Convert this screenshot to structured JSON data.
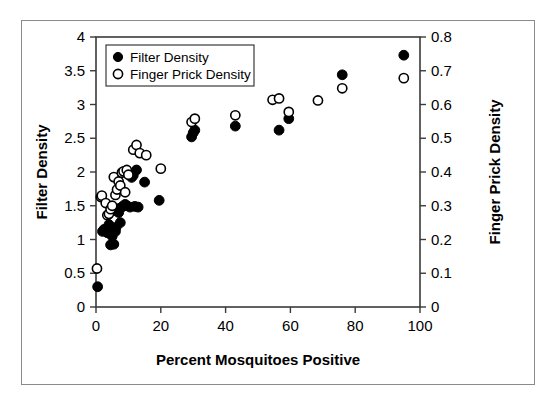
{
  "chart_data": {
    "type": "scatter",
    "title": "",
    "xlabel": "Percent Mosquitoes Positive",
    "ylabel": "Filter Density",
    "y2label": "Finger Prick Density",
    "xlim": [
      0,
      100
    ],
    "ylim": [
      0,
      4
    ],
    "y2lim": [
      0,
      0.8
    ],
    "grid": false,
    "legend_position": "top-left",
    "xticks": [
      "0",
      "20",
      "40",
      "60",
      "80",
      "100"
    ],
    "xtick_values": [
      0,
      20,
      40,
      60,
      80,
      100
    ],
    "yticks": [
      "0",
      "0.5",
      "1",
      "1.5",
      "2",
      "2.5",
      "3",
      "3.5",
      "4"
    ],
    "ytick_values": [
      0,
      0.5,
      1,
      1.5,
      2,
      2.5,
      3,
      3.5,
      4
    ],
    "y2ticks": [
      "0",
      "0.1",
      "0.2",
      "0.3",
      "0.4",
      "0.5",
      "0.6",
      "0.7",
      "0.8"
    ],
    "y2tick_values": [
      0,
      0.1,
      0.2,
      0.3,
      0.4,
      0.5,
      0.6,
      0.7,
      0.8
    ],
    "series": [
      {
        "name": "Filter Density",
        "marker": "filled-circle",
        "color": "#000000",
        "axis": "left",
        "points": [
          [
            0.5,
            0.3
          ],
          [
            2.0,
            1.12
          ],
          [
            2.5,
            1.15
          ],
          [
            3.5,
            1.1
          ],
          [
            4.0,
            1.22
          ],
          [
            4.5,
            0.92
          ],
          [
            5.0,
            1.05
          ],
          [
            5.5,
            0.93
          ],
          [
            6.0,
            1.12
          ],
          [
            6.2,
            1.18
          ],
          [
            6.5,
            1.42
          ],
          [
            7.0,
            1.4
          ],
          [
            7.2,
            1.46
          ],
          [
            7.5,
            1.25
          ],
          [
            8.0,
            1.48
          ],
          [
            8.5,
            1.5
          ],
          [
            9.0,
            1.52
          ],
          [
            9.5,
            1.5
          ],
          [
            10.5,
            1.48
          ],
          [
            11.0,
            1.92
          ],
          [
            11.5,
            1.95
          ],
          [
            12.0,
            1.49
          ],
          [
            12.5,
            2.03
          ],
          [
            13.0,
            1.48
          ],
          [
            15.0,
            1.85
          ],
          [
            19.5,
            1.58
          ],
          [
            29.5,
            2.52
          ],
          [
            30.0,
            2.58
          ],
          [
            30.5,
            2.62
          ],
          [
            43.0,
            2.68
          ],
          [
            56.5,
            2.62
          ],
          [
            59.5,
            2.79
          ],
          [
            76.0,
            3.44
          ],
          [
            95.0,
            3.73
          ]
        ]
      },
      {
        "name": "Finger Prick Density",
        "marker": "open-circle",
        "color": "#000000",
        "axis": "right",
        "points": [
          [
            0.3,
            0.114
          ],
          [
            1.5,
            0.326
          ],
          [
            1.8,
            0.33
          ],
          [
            3.0,
            0.308
          ],
          [
            3.5,
            0.272
          ],
          [
            4.0,
            0.276
          ],
          [
            4.5,
            0.29
          ],
          [
            5.0,
            0.3
          ],
          [
            5.5,
            0.385
          ],
          [
            6.0,
            0.332
          ],
          [
            6.5,
            0.348
          ],
          [
            7.0,
            0.372
          ],
          [
            7.5,
            0.36
          ],
          [
            8.0,
            0.398
          ],
          [
            8.5,
            0.402
          ],
          [
            9.0,
            0.34
          ],
          [
            9.5,
            0.406
          ],
          [
            10.0,
            0.392
          ],
          [
            11.5,
            0.466
          ],
          [
            12.5,
            0.48
          ],
          [
            13.5,
            0.456
          ],
          [
            15.5,
            0.45
          ],
          [
            20.0,
            0.41
          ],
          [
            29.5,
            0.548
          ],
          [
            30.5,
            0.558
          ],
          [
            43.0,
            0.568
          ],
          [
            54.5,
            0.614
          ],
          [
            56.5,
            0.618
          ],
          [
            59.5,
            0.578
          ],
          [
            68.5,
            0.612
          ],
          [
            76.0,
            0.648
          ],
          [
            95.0,
            0.678
          ]
        ]
      }
    ]
  },
  "legend": {
    "items": [
      {
        "label": "Filter Density",
        "marker": "filled-circle"
      },
      {
        "label": "Finger Prick Density",
        "marker": "open-circle"
      }
    ]
  }
}
